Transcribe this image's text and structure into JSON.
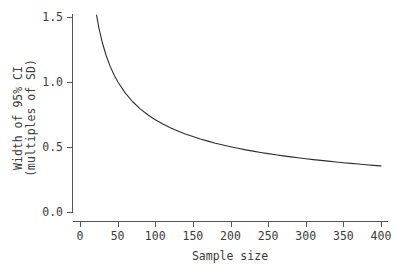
{
  "chart_data": {
    "type": "line",
    "title": "",
    "subtitle": "",
    "xlabel": "Sample size",
    "ylabel": "Width of 95% CI\n(multiples of SD)",
    "ylabel_line1": "Width of 95% CI",
    "ylabel_line2": "(multiples of SD)",
    "xlim": [
      0,
      410
    ],
    "ylim": [
      0.0,
      1.6
    ],
    "xticks": [
      0,
      50,
      100,
      150,
      200,
      250,
      300,
      350,
      400
    ],
    "xticklabels": [
      "0",
      "50",
      "100",
      "150",
      "200",
      "250",
      "300",
      "350",
      "400"
    ],
    "yticks": [
      0.0,
      0.5,
      1.0,
      1.5
    ],
    "yticklabels": [
      "0.0",
      "0.5",
      "1.0",
      "1.5"
    ],
    "grid": false,
    "legend": null,
    "legend_position": "none",
    "annotations": [],
    "line_color": "#2e2e2e",
    "axis_color": "#555555",
    "background_color": "#ffffff",
    "series": [
      {
        "name": "Width of 95% CI (multiples of SD)",
        "formula_description": "approximately 6.9 / sqrt(n)",
        "x": [
          22,
          25,
          30,
          35,
          40,
          45,
          50,
          60,
          70,
          80,
          90,
          100,
          110,
          120,
          130,
          140,
          150,
          160,
          170,
          180,
          190,
          200,
          210,
          220,
          230,
          240,
          250,
          260,
          270,
          280,
          290,
          300,
          310,
          320,
          330,
          340,
          350,
          360,
          370,
          380,
          390,
          400
        ],
        "values": [
          1.515,
          1.419,
          1.296,
          1.2,
          1.122,
          1.058,
          1.004,
          0.916,
          0.848,
          0.793,
          0.748,
          0.71,
          0.677,
          0.648,
          0.623,
          0.6,
          0.58,
          0.561,
          0.545,
          0.529,
          0.515,
          0.502,
          0.49,
          0.478,
          0.468,
          0.458,
          0.449,
          0.44,
          0.432,
          0.424,
          0.417,
          0.41,
          0.403,
          0.397,
          0.391,
          0.385,
          0.379,
          0.374,
          0.369,
          0.364,
          0.359,
          0.355
        ]
      }
    ],
    "key_readings": [
      {
        "x": 25,
        "y": 1.42
      },
      {
        "x": 50,
        "y": 1.0
      },
      {
        "x": 100,
        "y": 0.71
      },
      {
        "x": 150,
        "y": 0.58
      },
      {
        "x": 200,
        "y": 0.5
      },
      {
        "x": 250,
        "y": 0.45
      },
      {
        "x": 300,
        "y": 0.41
      },
      {
        "x": 350,
        "y": 0.38
      },
      {
        "x": 400,
        "y": 0.355
      }
    ]
  }
}
